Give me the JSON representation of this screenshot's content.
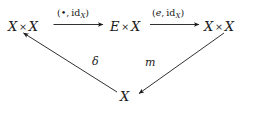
{
  "diagram": {
    "type": "commutative-diagram",
    "background_color": "#ffffff",
    "ink_color": "#1a1a1a",
    "nodes": [
      {
        "id": "left",
        "label": "X × X",
        "base": "X",
        "op": "×",
        "base2": "X"
      },
      {
        "id": "mid",
        "label": "E × X",
        "base": "E",
        "op": "×",
        "base2": "X"
      },
      {
        "id": "right",
        "label": "X × X",
        "base": "X",
        "op": "×",
        "base2": "X"
      },
      {
        "id": "bottom",
        "label": "X"
      }
    ],
    "edges": [
      {
        "id": "top-left",
        "from": "left",
        "to": "mid",
        "direction": "right",
        "label_open": "(",
        "label_first": "•",
        "label_comma": ", ",
        "label_id": "id",
        "label_sub": "X",
        "label_close": ")",
        "label_plain": "(•, id_X)"
      },
      {
        "id": "top-right",
        "from": "mid",
        "to": "right",
        "direction": "right",
        "label_open": "(",
        "label_first": "e",
        "label_comma": ", ",
        "label_id": "id",
        "label_sub": "X",
        "label_close": ")",
        "label_plain": "(e, id_X)"
      },
      {
        "id": "delta",
        "from": "bottom",
        "to": "left",
        "direction": "up-left",
        "label_plain": "δ"
      },
      {
        "id": "m",
        "from": "right",
        "to": "bottom",
        "direction": "down-left",
        "label_plain": "m"
      }
    ]
  }
}
